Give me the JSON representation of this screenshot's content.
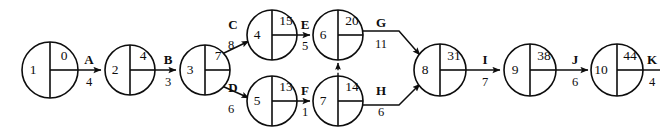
{
  "diagram": {
    "type": "activity-on-arrow-network",
    "node_label_scheme": "left-half: event number; right-upper: earliest event time",
    "width": 660,
    "height": 136,
    "colors": {
      "background": "#ffffff",
      "stroke": "#0d0d0d",
      "text": "#0d0d0d"
    }
  },
  "nodes": [
    {
      "id": "1",
      "value": "0",
      "cx": 50,
      "cy": 70,
      "r": 28
    },
    {
      "id": "2",
      "value": "4",
      "cx": 130,
      "cy": 70,
      "r": 25
    },
    {
      "id": "3",
      "value": "7",
      "cx": 205,
      "cy": 70,
      "r": 25
    },
    {
      "id": "4",
      "value": "15",
      "cx": 272,
      "cy": 35,
      "r": 25
    },
    {
      "id": "5",
      "value": "13",
      "cx": 272,
      "cy": 101,
      "r": 25
    },
    {
      "id": "6",
      "value": "20",
      "cx": 338,
      "cy": 35,
      "r": 25
    },
    {
      "id": "7",
      "value": "14",
      "cx": 338,
      "cy": 101,
      "r": 25
    },
    {
      "id": "8",
      "value": "31",
      "cx": 440,
      "cy": 70,
      "r": 26
    },
    {
      "id": "9",
      "value": "38",
      "cx": 530,
      "cy": 70,
      "r": 26
    },
    {
      "id": "10",
      "value": "44",
      "cx": 617,
      "cy": 70,
      "r": 26
    }
  ],
  "activities": [
    {
      "name": "A",
      "duration": "4",
      "from": "1",
      "to": "2",
      "label_x": 89,
      "name_y": 61,
      "dur_y": 83
    },
    {
      "name": "B",
      "duration": "3",
      "from": "2",
      "to": "3",
      "label_x": 168,
      "name_y": 61,
      "dur_y": 83
    },
    {
      "name": "C",
      "duration": "8",
      "from": "3",
      "to": "4",
      "label_x": 233,
      "name_y": 26,
      "dur_y": 46
    },
    {
      "name": "D",
      "duration": "6",
      "from": "3",
      "to": "5",
      "label_x": 233,
      "name_y": 89,
      "dur_y": 110
    },
    {
      "name": "E",
      "duration": "5",
      "from": "4",
      "to": "6",
      "label_x": 305,
      "name_y": 26,
      "dur_y": 47
    },
    {
      "name": "F",
      "duration": "1",
      "from": "5",
      "to": "7",
      "label_x": 305,
      "name_y": 92,
      "dur_y": 113
    },
    {
      "name": "G",
      "duration": "11",
      "from": "6",
      "to": "8",
      "label_x": 381,
      "name_y": 24,
      "dur_y": 45
    },
    {
      "name": "H",
      "duration": "6",
      "from": "7",
      "to": "8",
      "label_x": 381,
      "name_y": 92,
      "dur_y": 113
    },
    {
      "name": "I",
      "duration": "7",
      "from": "8",
      "to": "9",
      "label_x": 485,
      "name_y": 61,
      "dur_y": 83
    },
    {
      "name": "J",
      "duration": "6",
      "from": "9",
      "to": "10",
      "label_x": 575,
      "name_y": 61,
      "dur_y": 83
    },
    {
      "name": "K",
      "duration": "4",
      "from": "10",
      "to": "",
      "label_x": 652,
      "name_y": 61,
      "dur_y": 83
    }
  ],
  "dummy_activities": [
    {
      "from": "7",
      "to": "6",
      "style": "dashed"
    }
  ]
}
